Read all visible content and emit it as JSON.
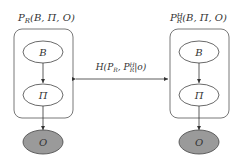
{
  "diagram": {
    "left_model": {
      "title": "P_R(B, Π, O)",
      "title_main": "P",
      "title_sub": "R",
      "title_args": "(B, Π, O)",
      "nodes": [
        {
          "id": "B",
          "label": "B",
          "observed": false
        },
        {
          "id": "Pi",
          "label": "Π",
          "observed": false
        },
        {
          "id": "O",
          "label": "O",
          "observed": true
        }
      ]
    },
    "right_model": {
      "title": "P_R^H(B, Π, O)",
      "title_main": "P",
      "title_sub": "R",
      "title_sup": "H",
      "title_args": "(B, Π, O)",
      "nodes": [
        {
          "id": "B",
          "label": "B",
          "observed": false
        },
        {
          "id": "Pi",
          "label": "Π",
          "observed": false
        },
        {
          "id": "O",
          "label": "O",
          "observed": true
        }
      ]
    },
    "connection": {
      "label": "H(P_R, P_R^H|o)",
      "label_prefix": "H(P",
      "label_sub1": "R",
      "label_mid": ", P",
      "label_sup2": "H",
      "label_sub2": "R",
      "label_suffix": "|o)",
      "direction": "bidirectional"
    },
    "colors": {
      "stroke": "#333333",
      "observed_fill": "#9a9a9a",
      "background": "#ffffff"
    }
  }
}
